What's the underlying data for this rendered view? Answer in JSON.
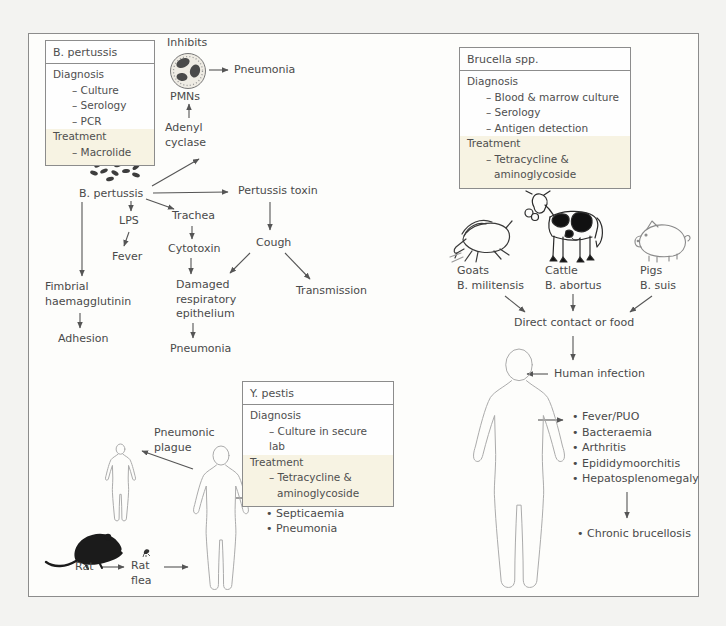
{
  "boxes": {
    "pertussis": {
      "title": "B. pertussis",
      "diagnosis_label": "Diagnosis",
      "diagnosis_items": [
        "– Culture",
        "– Serology",
        "– PCR"
      ],
      "treatment_label": "Treatment",
      "treatment_items": [
        "– Macrolide"
      ]
    },
    "brucella": {
      "title": "Brucella spp.",
      "diagnosis_label": "Diagnosis",
      "diagnosis_items": [
        "– Blood & marrow culture",
        "– Serology",
        "– Antigen detection"
      ],
      "treatment_label": "Treatment",
      "treatment_items": [
        "– Tetracycline &",
        "aminoglycoside"
      ]
    },
    "ypestis": {
      "title": "Y. pestis",
      "diagnosis_label": "Diagnosis",
      "diagnosis_items": [
        "– Culture in secure lab"
      ],
      "treatment_label": "Treatment",
      "treatment_items": [
        "– Tetracycline &",
        "aminoglycoside"
      ]
    }
  },
  "pertussis": {
    "inhibits": "Inhibits",
    "pmns": "PMNs",
    "pneumonia_top": "Pneumonia",
    "adenyl_cyclase": "Adenyl\ncyclase",
    "organism": "B. pertussis",
    "toxin": "Pertussis toxin",
    "lps": "LPS",
    "trachea": "Trachea",
    "fever": "Fever",
    "cytotoxin": "Cytotoxin",
    "fimbrial": "Fimbrial\nhaemagglutinin",
    "adhesion": "Adhesion",
    "damaged_epithelium": "Damaged\nrespiratory\nepithelium",
    "pneumonia_lower": "Pneumonia",
    "cough": "Cough",
    "transmission": "Transmission"
  },
  "brucella": {
    "goats": "Goats\nB. militensis",
    "cattle": "Cattle\nB. abortus",
    "pigs": "Pigs\nB. suis",
    "direct_contact": "Direct contact or food",
    "human_infection": "Human infection",
    "symptoms": [
      "• Fever/PUO",
      "• Bacteraemia",
      "• Arthritis",
      "• Epididymoorchitis",
      "• Hepatosplenomegaly"
    ],
    "chronic": "• Chronic brucellosis"
  },
  "plague": {
    "pneumonic": "Pneumonic\nplague",
    "symptoms": [
      "• Buboes",
      "• Septicaemia",
      "• Pneumonia"
    ],
    "rat": "Rat",
    "rat_flea": "Rat\nflea"
  },
  "illustrations": {
    "pmn_cell": "pmn-cell-icon",
    "bacteria_cluster": "b-pertussis-bacteria-icon",
    "goat": "goat-icon",
    "cattle": "cow-icon",
    "pig": "pig-icon",
    "human": "human-figure-icon",
    "rat": "rat-icon",
    "flea": "flea-icon"
  },
  "colors": {
    "ink": "#4a4a4a",
    "line": "#555555",
    "box_border": "#8c8c8c",
    "treatment_bg": "#f7f3e3",
    "panel_bg": "#fdfdfb",
    "page_bg": "#f3f3f1",
    "figure_gray": "#ababab",
    "rat_black": "#1b1b1b"
  }
}
